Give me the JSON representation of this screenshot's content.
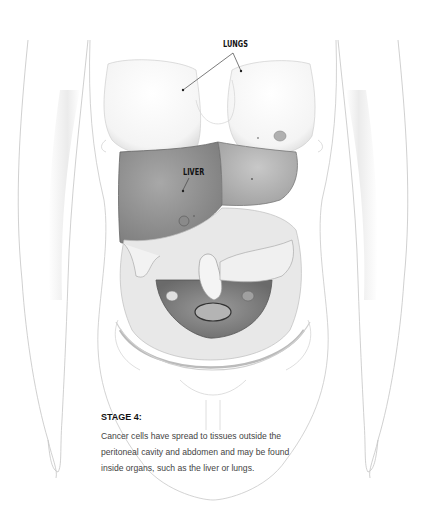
{
  "labels": {
    "lungs": "LUNGS",
    "liver": "LIVER"
  },
  "caption": {
    "title": "STAGE 4:",
    "lines": [
      "Cancer cells have spread to tissues outside the",
      "peritoneal cavity and abdomen and may be found",
      "inside organs, such as the liver or lungs."
    ]
  },
  "colors": {
    "background": "#ffffff",
    "outline": "#b8b8b8",
    "liver": "#8e8e8e",
    "text": "#111111"
  }
}
